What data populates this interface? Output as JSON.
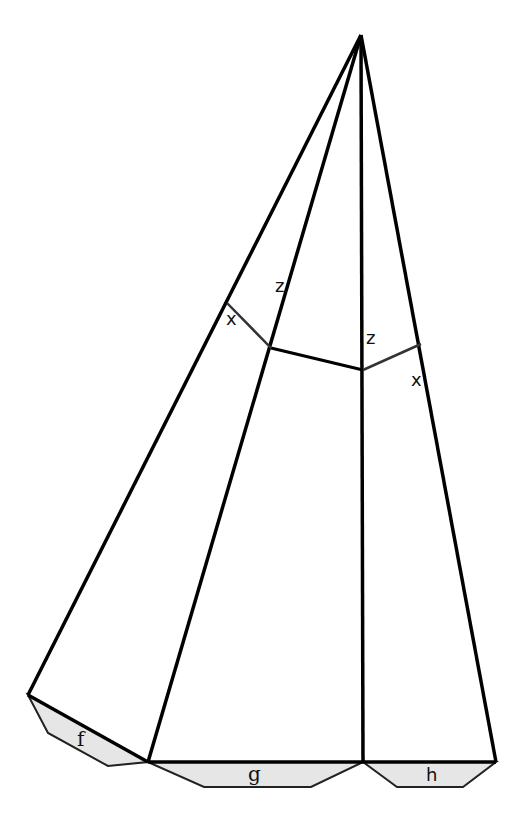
{
  "diagram": {
    "colors": {
      "line": "#000000",
      "tab_fill": "#e6e6e6",
      "tab_stroke": "#222222",
      "background": "#ffffff"
    },
    "labels": {
      "z_left": "z",
      "z_right": "z",
      "x_left": "x",
      "x_right": "x",
      "tab_f": "f",
      "tab_g": "g",
      "tab_h": "h"
    }
  }
}
